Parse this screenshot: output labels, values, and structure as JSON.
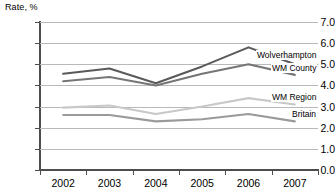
{
  "chart_data": {
    "type": "line",
    "title": "",
    "ylabel": "Rate, %",
    "xlabel": "",
    "categories": [
      "2002",
      "2003",
      "2004",
      "2005",
      "2006",
      "2007"
    ],
    "ylim": [
      0.0,
      7.0
    ],
    "ytick_labels": [
      "0.0",
      "1.0",
      "2.0",
      "3.0",
      "4.0",
      "5.0",
      "6.0",
      "7.0"
    ],
    "ytick_values": [
      0.0,
      1.0,
      2.0,
      3.0,
      4.0,
      5.0,
      6.0,
      7.0
    ],
    "grid": true,
    "legend_position": "right-inline-labels",
    "series": [
      {
        "name": "Wolverhampton",
        "color": "#5a5a5a",
        "values": [
          4.55,
          4.8,
          4.1,
          4.9,
          5.8,
          5.0
        ]
      },
      {
        "name": "WM County",
        "color": "#767676",
        "values": [
          4.2,
          4.4,
          4.0,
          4.55,
          5.0,
          4.5
        ]
      },
      {
        "name": "WM Region",
        "color": "#c8c8c8",
        "values": [
          2.95,
          3.05,
          2.65,
          3.0,
          3.4,
          3.1
        ]
      },
      {
        "name": "Britain",
        "color": "#9a9a9a",
        "values": [
          2.6,
          2.6,
          2.3,
          2.4,
          2.65,
          2.3
        ]
      }
    ]
  },
  "colors": {
    "axis": "#4d4d4d",
    "grid": "#b9b9b9",
    "text": "#000000",
    "background": "#ffffff"
  }
}
